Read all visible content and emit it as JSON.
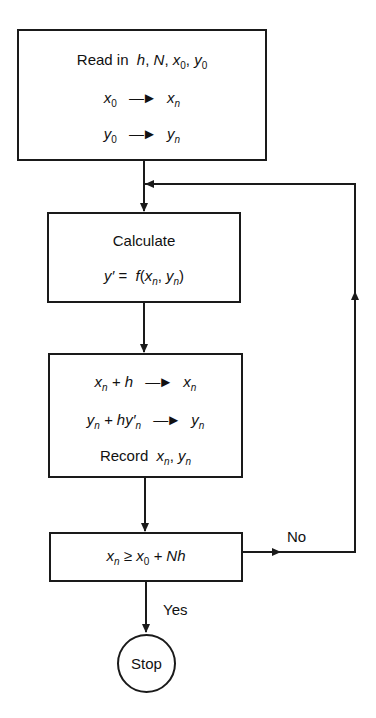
{
  "flowchart": {
    "title": "Euler method flowchart",
    "box_input": {
      "line1_prefix": "Read in",
      "line1_vars": [
        "h",
        "N",
        "x",
        "y"
      ],
      "line2": {
        "from": "x",
        "from_sub": "0",
        "to": "x",
        "to_sub": "n"
      },
      "line3": {
        "from": "y",
        "from_sub": "0",
        "to": "y",
        "to_sub": "n"
      }
    },
    "box_calculate": {
      "line1": "Calculate",
      "line2": {
        "lhs": "y′ =",
        "fn": "f",
        "arg1": "x",
        "arg1_sub": "n",
        "arg2": "y",
        "arg2_sub": "n"
      }
    },
    "box_update": {
      "line1": {
        "a": "x",
        "a_sub": "n",
        "op": "+ h",
        "to": "x",
        "to_sub": "n"
      },
      "line2": {
        "a": "y",
        "a_sub": "n",
        "op": "+ hy′",
        "op_sub": "n",
        "to": "y",
        "to_sub": "n"
      },
      "line3": {
        "label": "Record",
        "v1": "x",
        "v1_sub": "n",
        "v2": "y",
        "v2_sub": "n"
      }
    },
    "box_decision": {
      "lhs": "x",
      "lhs_sub": "n",
      "op": "≥",
      "rhs": "x",
      "rhs_sub": "0",
      "rhs_tail": "+ Nh"
    },
    "branch_no": "No",
    "branch_yes": "Yes",
    "terminal": "Stop",
    "arrow_glyph": "—►",
    "line_color": "#1a1a1a"
  }
}
